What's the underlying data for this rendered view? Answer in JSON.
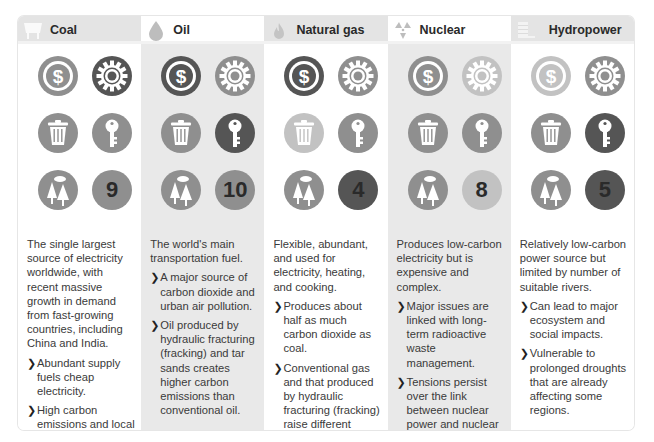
{
  "colors": {
    "dark": "#555555",
    "medium": "#8f8f8f",
    "light": "#c2c2c2",
    "number_text": "#2a2a2a"
  },
  "columns": [
    {
      "title": "Coal",
      "header_icon": "coal-cart-icon",
      "icons": {
        "cost": {
          "icon": "dollar-icon",
          "shade": "medium"
        },
        "technology": {
          "icon": "gear-icon",
          "shade": "dark"
        },
        "waste": {
          "icon": "trash-icon",
          "shade": "medium"
        },
        "security": {
          "icon": "key-icon",
          "shade": "medium"
        },
        "environment": {
          "icon": "trees-icon",
          "shade": "medium"
        },
        "score": {
          "value": "9",
          "shade": "medium"
        }
      },
      "intro": "The single largest source of electricity worldwide, with recent massive growth in demand from fast-growing countries, including China and India.",
      "bullets": [
        "Abundant supply fuels cheap electricity.",
        "High carbon emissions and local air pollution."
      ]
    },
    {
      "title": "Oil",
      "header_icon": "oil-drop-icon",
      "icons": {
        "cost": {
          "icon": "dollar-icon",
          "shade": "dark"
        },
        "technology": {
          "icon": "gear-icon",
          "shade": "medium"
        },
        "waste": {
          "icon": "trash-icon",
          "shade": "medium"
        },
        "security": {
          "icon": "key-icon",
          "shade": "dark"
        },
        "environment": {
          "icon": "trees-icon",
          "shade": "medium"
        },
        "score": {
          "value": "10",
          "shade": "medium"
        }
      },
      "intro": "The world's main transportation fuel.",
      "bullets": [
        "A major source of carbon dioxide and urban air pollution.",
        "Oil produced by hydraulic fracturing (fracking) and tar sands creates higher carbon emissions than conventional oil."
      ]
    },
    {
      "title": "Natural gas",
      "header_icon": "gas-flame-icon",
      "icons": {
        "cost": {
          "icon": "dollar-icon",
          "shade": "dark"
        },
        "technology": {
          "icon": "gear-icon",
          "shade": "medium"
        },
        "waste": {
          "icon": "trash-icon",
          "shade": "light"
        },
        "security": {
          "icon": "key-icon",
          "shade": "medium"
        },
        "environment": {
          "icon": "trees-icon",
          "shade": "medium"
        },
        "score": {
          "value": "4",
          "shade": "dark"
        }
      },
      "intro": "Flexible, abundant, and used for electricity, heating, and cooking.",
      "bullets": [
        "Produces about half as much carbon dioxide as coal.",
        "Conventional gas and that produced by hydraulic fracturing (fracking) raise different issues."
      ]
    },
    {
      "title": "Nuclear",
      "header_icon": "radiation-icon",
      "icons": {
        "cost": {
          "icon": "dollar-icon",
          "shade": "medium"
        },
        "technology": {
          "icon": "gear-icon",
          "shade": "light"
        },
        "waste": {
          "icon": "trash-icon",
          "shade": "medium"
        },
        "security": {
          "icon": "key-icon",
          "shade": "medium"
        },
        "environment": {
          "icon": "trees-icon",
          "shade": "medium"
        },
        "score": {
          "value": "8",
          "shade": "light"
        }
      },
      "intro": "Produces low-carbon electricity but is expensive and complex.",
      "bullets": [
        "Major issues are linked with long-term radioactive waste management.",
        "Tensions persist over the link between nuclear power and nuclear weapons."
      ]
    },
    {
      "title": "Hydropower",
      "header_icon": "dam-icon",
      "icons": {
        "cost": {
          "icon": "dollar-icon",
          "shade": "light"
        },
        "technology": {
          "icon": "gear-icon",
          "shade": "medium"
        },
        "waste": {
          "icon": "trash-icon",
          "shade": "medium"
        },
        "security": {
          "icon": "key-icon",
          "shade": "dark"
        },
        "environment": {
          "icon": "trees-icon",
          "shade": "medium"
        },
        "score": {
          "value": "5",
          "shade": "dark"
        }
      },
      "intro": "Relatively low-carbon power source but limited by number of suitable rivers.",
      "bullets": [
        "Can lead to major ecosystem and social impacts.",
        "Vulnerable to prolonged droughts that are already affecting some regions."
      ]
    }
  ],
  "bullet_glyph": "❯"
}
